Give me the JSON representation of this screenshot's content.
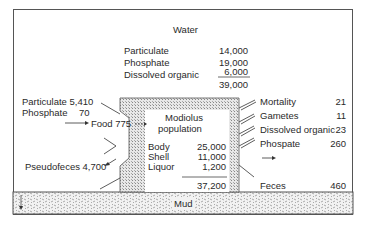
{
  "water": {
    "title": "Water",
    "rows": [
      {
        "label": "Particulate",
        "value": "14,000"
      },
      {
        "label": "Phosphate",
        "value": "19,000"
      },
      {
        "label": "Dissolved organic",
        "value": "6,000"
      }
    ],
    "total": "39,000"
  },
  "inputs": {
    "particulate": "Particulate 5,410",
    "phosphate_label": "Phosphate",
    "phosphate_value": "70",
    "food": "Food 775",
    "pseudofeces": "Pseudofeces 4,700"
  },
  "population": {
    "title_line1": "Modiolus",
    "title_line2": "population",
    "rows": [
      {
        "label": "Body",
        "value": "25,000"
      },
      {
        "label": "Shell",
        "value": "11,000"
      },
      {
        "label": "Liquor",
        "value": "1,200"
      }
    ],
    "total": "37,200"
  },
  "outputs": [
    {
      "label": "Mortality",
      "value": "21"
    },
    {
      "label": "Gametes",
      "value": "11"
    },
    {
      "label": "Dissolved organic",
      "value": "23"
    },
    {
      "label": "Phospate",
      "value": "260"
    },
    {
      "label": "Feces",
      "value": "460"
    }
  ],
  "sediment": {
    "label": "Mud"
  }
}
